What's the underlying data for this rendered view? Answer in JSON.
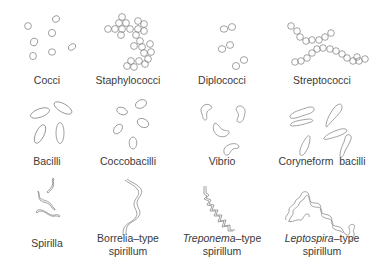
{
  "figure": {
    "cells": [
      {
        "id": "cocci",
        "label": "Cocci",
        "x": 47,
        "y": 80
      },
      {
        "id": "staphylococci",
        "label": "Staphylococci",
        "x": 128,
        "y": 80
      },
      {
        "id": "diplococci",
        "label": "Diplococci",
        "x": 222,
        "y": 80
      },
      {
        "id": "streptococci",
        "label": "Streptococci",
        "x": 322,
        "y": 80
      },
      {
        "id": "bacilli",
        "label": "Bacilli",
        "x": 47,
        "y": 161
      },
      {
        "id": "coccobacilli",
        "label": "Coccobacilli",
        "x": 128,
        "y": 161
      },
      {
        "id": "vibrio",
        "label": "Vibrio",
        "x": 222,
        "y": 161
      },
      {
        "id": "coryneform",
        "label": "Coryneform  bacilli",
        "x": 322,
        "y": 161
      },
      {
        "id": "spirilla",
        "label": "Spirilla",
        "x": 47,
        "y": 239
      },
      {
        "id": "borrelia",
        "label": "Borrelia–type",
        "label2": "spirillum",
        "x": 128,
        "y": 232
      },
      {
        "id": "treponema",
        "label_italic": "Treponema",
        "label_rest": "–type",
        "label2": "spirillum",
        "x": 222,
        "y": 232
      },
      {
        "id": "leptospira",
        "label_italic": "Leptospira",
        "label_rest": "–type",
        "label2": "spirillum",
        "x": 322,
        "y": 232
      }
    ],
    "colors": {
      "stroke": "#8a8a8a",
      "text": "#3a3a3a",
      "background": "#ffffff"
    }
  }
}
